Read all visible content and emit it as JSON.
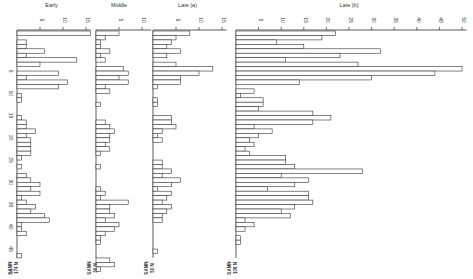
{
  "chart_data": {
    "type": "bar",
    "orientation": "horizontal",
    "title": "",
    "ylabel": "",
    "row_tick_labels": [
      "5",
      "10",
      "15",
      "20",
      "25",
      "30",
      "35",
      "40",
      "45",
      "50"
    ],
    "row_tick_positions": [
      5,
      10,
      15,
      20,
      25,
      30,
      35,
      40,
      45,
      50
    ],
    "panels": [
      {
        "name": "Early",
        "x0": 17,
        "px_per_unit": 4.6,
        "ticks": [
          5,
          10,
          15
        ],
        "axis_max": 16,
        "footer": [
          "SAMN",
          "174 N"
        ],
        "values": [
          16,
          0,
          2,
          2,
          6,
          2,
          13,
          5,
          0,
          9,
          2,
          11,
          9,
          0,
          1,
          1,
          0,
          0,
          0,
          1,
          2,
          2,
          4,
          2,
          3,
          3,
          3,
          3,
          1,
          0,
          1,
          0,
          2,
          3,
          5,
          3,
          5,
          1,
          2,
          4,
          3,
          6,
          7,
          1,
          1,
          2,
          0,
          0,
          0,
          0,
          1
        ]
      },
      {
        "name": "Middle",
        "x0": 96,
        "px_per_unit": 4.6,
        "ticks": [
          5,
          10
        ],
        "axis_max": 12,
        "footer": [
          "SAMN",
          "30 N"
        ],
        "values": [
          5,
          2,
          1,
          1,
          3,
          1,
          2,
          0,
          6,
          7,
          5,
          7,
          2,
          3,
          0,
          0,
          1,
          0,
          0,
          0,
          2,
          3,
          4,
          3,
          3,
          2,
          3,
          1,
          0,
          0,
          1,
          0,
          0,
          0,
          0,
          1,
          2,
          1,
          7,
          3,
          3,
          4,
          2,
          5,
          4,
          2,
          1,
          1,
          0,
          0,
          0,
          3,
          4,
          1,
          0
        ]
      },
      {
        "name": "Late (a)",
        "x0": 153,
        "px_per_unit": 4.6,
        "ticks": [
          5,
          10,
          15
        ],
        "axis_max": 16,
        "footer": [
          "SAMN",
          "50 N"
        ],
        "values": [
          8,
          5,
          4,
          3,
          6,
          3,
          0,
          5,
          13,
          10,
          6,
          6,
          1,
          0,
          0,
          1,
          1,
          0,
          0,
          4,
          4,
          5,
          2,
          1,
          2,
          0,
          0,
          0,
          0,
          2,
          2,
          4,
          2,
          6,
          4,
          1,
          4,
          3,
          2,
          4,
          3,
          2,
          2,
          0,
          0,
          0,
          0,
          0,
          0,
          1,
          0
        ]
      },
      {
        "name": "Late (b)",
        "x0": 236,
        "px_per_unit": 4.52,
        "ticks": [
          5,
          10,
          15,
          20,
          25,
          30,
          35,
          40,
          45,
          50
        ],
        "axis_max": 51,
        "footer": [
          "SAMN",
          "108 N"
        ],
        "values": [
          22,
          19,
          9,
          15,
          32,
          23,
          11,
          27,
          50,
          44,
          30,
          14,
          0,
          4,
          1,
          6,
          6,
          5,
          17,
          21,
          17,
          4,
          8,
          5,
          3,
          4,
          2,
          3,
          11,
          11,
          13,
          28,
          10,
          16,
          13,
          7,
          16,
          16,
          17,
          13,
          10,
          12,
          2,
          4,
          2,
          0,
          1,
          1,
          0
        ]
      }
    ],
    "row_y0": 31,
    "row_height": 4.45,
    "bar_fill": "#ffffff",
    "bar_stroke": "#333333",
    "axis_color": "#333333"
  }
}
